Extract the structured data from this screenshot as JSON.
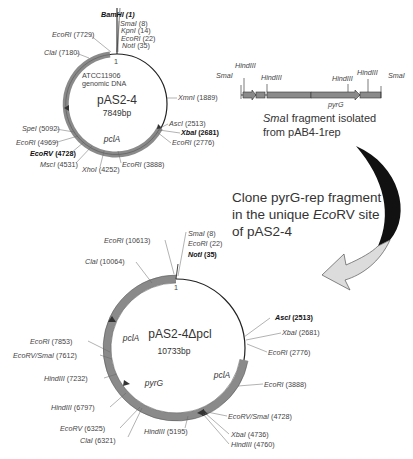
{
  "plasmid1": {
    "name": "pAS2-4",
    "size": "7849bp",
    "insert_label": [
      "ATCC11906",
      "genomic DNA"
    ],
    "gene": "pclA",
    "origin": "1",
    "sites": [
      {
        "enzyme": "BamHI",
        "pos": "(1)",
        "bold": true
      },
      {
        "enzyme": "SmaI",
        "pos": "(8)"
      },
      {
        "enzyme": "KpnI",
        "pos": "(14)"
      },
      {
        "enzyme": "EcoRI",
        "pos": "(22)"
      },
      {
        "enzyme": "NotI",
        "pos": "(35)"
      },
      {
        "enzyme": "XmnI",
        "pos": "(1889)"
      },
      {
        "enzyme": "AscI",
        "pos": "(2513)"
      },
      {
        "enzyme": "XbaI",
        "pos": "(2681)",
        "bold": true
      },
      {
        "enzyme": "EcoRI",
        "pos": "(2776)"
      },
      {
        "enzyme": "EcoRI",
        "pos": "(3888)"
      },
      {
        "enzyme": "XhoI",
        "pos": "(4252)"
      },
      {
        "enzyme": "MscI",
        "pos": "(4531)"
      },
      {
        "enzyme": "EcoRV",
        "pos": "(4728)",
        "bold": true
      },
      {
        "enzyme": "EcoRI",
        "pos": "(4969)"
      },
      {
        "enzyme": "SpeI",
        "pos": "(5092)"
      },
      {
        "enzyme": "ClaI",
        "pos": "(7180)"
      },
      {
        "enzyme": "EcoRI",
        "pos": "(7729)"
      }
    ]
  },
  "fragment": {
    "labels": [
      "SmaI",
      "HindIII",
      "HindIII",
      "HindIII",
      "HindIII",
      "SmaI"
    ],
    "gene": "pyrG",
    "caption_line1_italic": "Sma",
    "caption_line1_rest": "I fragment isolated",
    "caption_line2": "from pAB4-1rep"
  },
  "instruction": {
    "line1": "Clone pyrG-rep fragment",
    "line2_a": "in the unique ",
    "line2_italic": "Eco",
    "line2_b": "RV site",
    "line3": "of pAS2-4"
  },
  "plasmid2": {
    "name": "pAS2-4Δpcl",
    "size": "10733bp",
    "genes": [
      "pclA",
      "pyrG",
      "pclA"
    ],
    "origin": "1",
    "sites": [
      {
        "enzyme": "SmaI",
        "pos": "(8)"
      },
      {
        "enzyme": "EcoRI",
        "pos": "(22)"
      },
      {
        "enzyme": "NotI",
        "pos": "(35)",
        "bold": true
      },
      {
        "enzyme": "AscI",
        "pos": "(2513)",
        "bold": true
      },
      {
        "enzyme": "XbaI",
        "pos": "(2681)"
      },
      {
        "enzyme": "EcoRI",
        "pos": "(2776)"
      },
      {
        "enzyme": "EcoRI",
        "pos": "(3888)"
      },
      {
        "enzyme": "EcoRV/SmaI",
        "pos": "(4728)"
      },
      {
        "enzyme": "XbaI",
        "pos": "(4736)"
      },
      {
        "enzyme": "HindIII",
        "pos": "(4760)"
      },
      {
        "enzyme": "HindIII",
        "pos": "(5195)"
      },
      {
        "enzyme": "ClaI",
        "pos": "(6321)"
      },
      {
        "enzyme": "EcoRV",
        "pos": "(6325)"
      },
      {
        "enzyme": "HindIII",
        "pos": "(6797)"
      },
      {
        "enzyme": "HindIII",
        "pos": "(7232)"
      },
      {
        "enzyme": "EcoRV/SmaI",
        "pos": "(7612)"
      },
      {
        "enzyme": "EcoRI",
        "pos": "(7853)"
      },
      {
        "enzyme": "ClaI",
        "pos": "(10064)"
      },
      {
        "enzyme": "EcoRI",
        "pos": "(10613)"
      }
    ]
  },
  "colors": {
    "backbone": "#222222",
    "feature": "#8a8a8a",
    "feature_dark": "#555555",
    "arrow_top": "#111111",
    "arrow_bottom": "#dcdcdc"
  }
}
